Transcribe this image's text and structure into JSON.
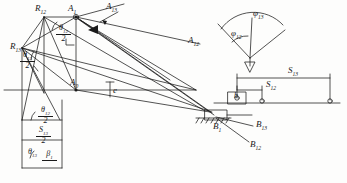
{
  "figure": {
    "kind": "kinematic-synthesis-diagram",
    "ink_color": "#1a1a1a",
    "paper_color": "#fdfdfc"
  },
  "left_construction": {
    "points": [
      {
        "id": "R13",
        "label": "R",
        "sub": "13",
        "x": 10,
        "y": 42
      },
      {
        "id": "R12",
        "label": "R",
        "sub": "12",
        "x": 35,
        "y": 10
      },
      {
        "id": "A1_top",
        "label": "A",
        "sub": "1",
        "x": 68,
        "y": 10
      },
      {
        "id": "A13",
        "label": "A",
        "sub": "13",
        "x": 106,
        "y": 4
      },
      {
        "id": "A12",
        "label": "A",
        "sub": "12",
        "x": 188,
        "y": 38
      },
      {
        "id": "A0",
        "label": "A",
        "sub": "0",
        "x": 72,
        "y": 82
      },
      {
        "id": "B1",
        "label": "B",
        "sub": "1",
        "x": 215,
        "y": 128
      },
      {
        "id": "B13",
        "label": "B",
        "sub": "13",
        "x": 258,
        "y": 125
      },
      {
        "id": "B12",
        "label": "B",
        "sub": "12",
        "x": 252,
        "y": 145
      }
    ],
    "offset_label": {
      "text": "e",
      "x": 113,
      "y": 88
    }
  },
  "angle_labels": [
    {
      "id": "theta12-half-upper",
      "num": "θ",
      "sub": "12",
      "den": "2",
      "x": 60,
      "y": 28
    },
    {
      "id": "theta13-half-left",
      "num": "θ",
      "sub": "13",
      "den": "2",
      "x": 24,
      "y": 55
    },
    {
      "id": "theta12-half-lower",
      "num": "θ",
      "sub": "12",
      "den": "2",
      "x": 42,
      "y": 110
    },
    {
      "id": "s13-half",
      "num": "S",
      "sub": "13",
      "den": "2",
      "x": 40,
      "y": 130
    },
    {
      "id": "theta13-half-lower",
      "num": "θ",
      "sub": "13",
      "den": "2",
      "x": 45,
      "y": 155
    },
    {
      "id": "beta1",
      "num": "β",
      "sub": "1",
      "den": "",
      "x": 28,
      "y": 150
    }
  ],
  "sector": {
    "name": "rotation-angle-sector",
    "phi13": {
      "label": "φ",
      "sub": "13",
      "x": 253,
      "y": 11
    },
    "phi12": {
      "label": "φ",
      "sub": "12",
      "x": 231,
      "y": 31
    }
  },
  "slider_diagram": {
    "name": "slider-displacement-diagram",
    "s13": {
      "label": "S",
      "sub": "13",
      "x": 294,
      "y": 71
    },
    "s12": {
      "label": "S",
      "sub": "12",
      "x": 285,
      "y": 86
    },
    "block_label": {
      "text": "b",
      "x": 236,
      "y": 95
    }
  }
}
